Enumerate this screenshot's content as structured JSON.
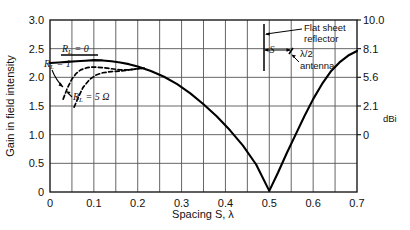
{
  "chart_data": {
    "type": "line",
    "title": "",
    "xlabel": "Spacing S, λ",
    "ylabel": "Gain in field intensity",
    "xlim": [
      0,
      0.7
    ],
    "ylim": [
      0,
      3.0
    ],
    "grid": true,
    "x_ticks": [
      "0",
      "0.1",
      "0.2",
      "0.3",
      "0.4",
      "0.5",
      "0.6",
      "0.7"
    ],
    "x_tick_values": [
      0,
      0.1,
      0.2,
      0.3,
      0.4,
      0.5,
      0.6,
      0.7
    ],
    "x_minor_step": 0.05,
    "y_ticks": [
      "0",
      "0.5",
      "1.0",
      "1.5",
      "2.0",
      "2.5",
      "3.0"
    ],
    "y_tick_values": [
      0,
      0.5,
      1.0,
      1.5,
      2.0,
      2.5,
      3.0
    ],
    "secondary_axis": {
      "label": "dBi",
      "ticks": [
        "0",
        "2.1",
        "5.6",
        "8.1",
        "10.0",
        "11.6"
      ],
      "tick_values": [
        0,
        2.1,
        5.6,
        8.1,
        10.0,
        11.6
      ],
      "at_gain": [
        1.0,
        1.5,
        2.0,
        2.5,
        3.0,
        3.5
      ]
    },
    "legend_position": "inline-annotations",
    "series": [
      {
        "name": "R_L = 0",
        "style": "solid",
        "label_text_main": "R",
        "label_text_sub": "L",
        "label_text_rest": " = 0",
        "points": [
          [
            0.0,
            2.25
          ],
          [
            0.02,
            2.26
          ],
          [
            0.04,
            2.27
          ],
          [
            0.06,
            2.28
          ],
          [
            0.08,
            2.29
          ],
          [
            0.1,
            2.3
          ],
          [
            0.12,
            2.295
          ],
          [
            0.14,
            2.28
          ],
          [
            0.16,
            2.26
          ],
          [
            0.18,
            2.23
          ],
          [
            0.2,
            2.19
          ],
          [
            0.23,
            2.11
          ],
          [
            0.26,
            2.01
          ],
          [
            0.29,
            1.88
          ],
          [
            0.32,
            1.72
          ],
          [
            0.35,
            1.53
          ],
          [
            0.38,
            1.32
          ],
          [
            0.41,
            1.08
          ],
          [
            0.44,
            0.81
          ],
          [
            0.47,
            0.48
          ],
          [
            0.5,
            0.02
          ],
          [
            0.52,
            0.34
          ],
          [
            0.54,
            0.68
          ],
          [
            0.56,
            1.0
          ],
          [
            0.58,
            1.32
          ],
          [
            0.6,
            1.62
          ],
          [
            0.62,
            1.88
          ],
          [
            0.64,
            2.1
          ],
          [
            0.66,
            2.26
          ],
          [
            0.68,
            2.38
          ],
          [
            0.7,
            2.46
          ]
        ]
      },
      {
        "name": "R_L = 1",
        "style": "dashed",
        "label_text_main": "R",
        "label_text_sub": "L",
        "label_text_rest": " = 1",
        "points": [
          [
            0.03,
            1.62
          ],
          [
            0.04,
            1.82
          ],
          [
            0.05,
            1.97
          ],
          [
            0.06,
            2.07
          ],
          [
            0.07,
            2.13
          ],
          [
            0.085,
            2.17
          ],
          [
            0.1,
            2.18
          ],
          [
            0.12,
            2.17
          ],
          [
            0.14,
            2.15
          ],
          [
            0.16,
            2.13
          ],
          [
            0.18,
            2.13
          ],
          [
            0.2,
            2.15
          ],
          [
            0.215,
            2.16
          ]
        ]
      },
      {
        "name": "R_L = 5 Ω",
        "style": "dashed",
        "label_text_main": "R",
        "label_text_sub": "L",
        "label_text_rest": " = 5 Ω",
        "points": [
          [
            0.055,
            1.48
          ],
          [
            0.065,
            1.66
          ],
          [
            0.075,
            1.82
          ],
          [
            0.09,
            1.96
          ],
          [
            0.105,
            2.04
          ],
          [
            0.12,
            2.08
          ],
          [
            0.14,
            2.1
          ],
          [
            0.16,
            2.11
          ],
          [
            0.18,
            2.13
          ],
          [
            0.2,
            2.15
          ],
          [
            0.215,
            2.16
          ]
        ]
      }
    ],
    "annotations": {
      "diagram": {
        "reflector_label_line1": "Flat sheet",
        "reflector_label_line2": "reflector",
        "spacing_symbol": "S",
        "antenna_label_line1": "λ/2",
        "antenna_label_line2": "antenna"
      }
    }
  },
  "colors": {
    "axis": "#1a1a1a",
    "grid": "#555555",
    "curve": "#000000",
    "background": "#ffffff"
  }
}
